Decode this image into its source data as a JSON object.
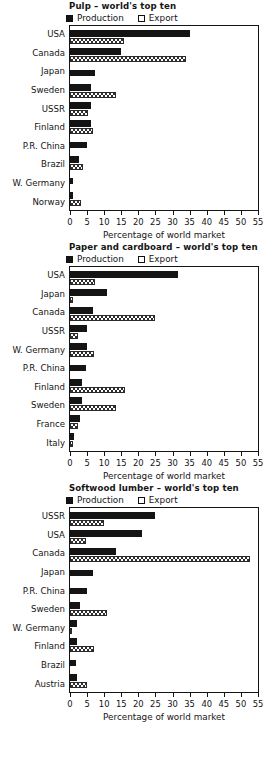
{
  "axis": {
    "xlabel": "Percentage of world market",
    "ticks": [
      0,
      5,
      10,
      15,
      20,
      25,
      30,
      35,
      40,
      45,
      50,
      55
    ],
    "xlim": [
      0,
      55
    ]
  },
  "legend": {
    "production": "Production",
    "export": "Export",
    "prod_color": "#141414",
    "exp_color": "#ffffff"
  },
  "chart_data": [
    {
      "type": "bar",
      "title": "Pulp – world's top ten",
      "xlabel": "Percentage of world market",
      "ylabel": "",
      "xlim": [
        0,
        55
      ],
      "orientation": "horizontal",
      "grid": false,
      "legend_position": "above-left",
      "categories": [
        "USA",
        "Canada",
        "Japan",
        "Sweden",
        "USSR",
        "Finland",
        "P.R. China",
        "Brazil",
        "W. Germany",
        "Norway"
      ],
      "series": [
        {
          "name": "Production",
          "values": [
            35.0,
            14.8,
            7.2,
            6.2,
            6.0,
            6.0,
            5.0,
            2.6,
            1.0,
            0.9
          ]
        },
        {
          "name": "Export",
          "values": [
            15.8,
            33.8,
            0.0,
            13.5,
            5.2,
            6.8,
            0.0,
            3.8,
            0.0,
            3.1
          ]
        }
      ]
    },
    {
      "type": "bar",
      "title": "Paper and cardboard – world's top ten",
      "xlabel": "Percentage of world market",
      "ylabel": "",
      "xlim": [
        0,
        55
      ],
      "orientation": "horizontal",
      "grid": false,
      "legend_position": "above-left",
      "categories": [
        "USA",
        "Japan",
        "Canada",
        "USSR",
        "W. Germany",
        "P.R. China",
        "Finland",
        "Sweden",
        "France",
        "Italy"
      ],
      "series": [
        {
          "name": "Production",
          "values": [
            31.5,
            10.8,
            6.6,
            4.9,
            4.9,
            4.8,
            3.5,
            3.4,
            2.8,
            1.3
          ]
        },
        {
          "name": "Export",
          "values": [
            7.4,
            1.0,
            24.8,
            2.4,
            7.0,
            0.0,
            16.2,
            13.4,
            2.2,
            0.8
          ]
        }
      ]
    },
    {
      "type": "bar",
      "title": "Softwood lumber – world's top ten",
      "xlabel": "Percentage of world market",
      "ylabel": "",
      "xlim": [
        0,
        55
      ],
      "orientation": "horizontal",
      "grid": false,
      "legend_position": "above-left",
      "categories": [
        "USSR",
        "USA",
        "Canada",
        "Japan",
        "P.R. China",
        "Sweden",
        "W. Germany",
        "Finland",
        "Brazil",
        "Austria"
      ],
      "series": [
        {
          "name": "Production",
          "values": [
            24.8,
            21.0,
            13.6,
            6.8,
            5.0,
            3.0,
            2.0,
            2.0,
            1.9,
            2.1
          ]
        },
        {
          "name": "Export",
          "values": [
            10.0,
            4.8,
            52.8,
            0.0,
            0.0,
            10.8,
            0.5,
            6.9,
            0.0,
            5.0
          ]
        }
      ]
    }
  ]
}
